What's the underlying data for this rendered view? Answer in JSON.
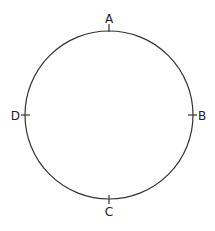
{
  "diagram": {
    "shape": "circle",
    "center": [
      109,
      115
    ],
    "radius": 84,
    "stroke_color": "#333333",
    "points": [
      {
        "label": "A",
        "position": "top"
      },
      {
        "label": "B",
        "position": "right"
      },
      {
        "label": "C",
        "position": "bottom"
      },
      {
        "label": "D",
        "position": "left"
      }
    ]
  }
}
